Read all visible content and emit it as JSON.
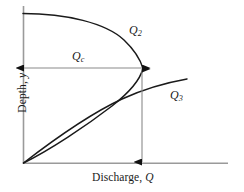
{
  "figure": {
    "type": "diagram",
    "axes": {
      "x_label_text": "Discharge, ",
      "x_label_symbol": "Q",
      "y_label_text": "Depth, ",
      "y_label_symbol": "y",
      "x_axis_name": "Discharge",
      "y_axis_name": "Depth",
      "x_axis_color": "#9a9a9a",
      "y_axis_color": "#9a9a9a",
      "x_origin_px": 23,
      "y_origin_px": 163,
      "x_end_px": 228,
      "y_top_px": 6
    },
    "curve_color": "#1a1a1a",
    "dimension_color": "#7a7a7a",
    "labels": {
      "q2": {
        "symbol": "Q",
        "subscript": "2",
        "x_px": 129,
        "y_px": 24
      },
      "q3": {
        "symbol": "Q",
        "subscript": "3",
        "x_px": 170,
        "y_px": 89
      },
      "qc": {
        "symbol": "Q",
        "subscript": "c",
        "x_px": 72,
        "y_px": 50
      }
    },
    "dimensions": {
      "qc_arrow": {
        "name": "critical-discharge-dimension",
        "orientation": "horizontal",
        "x1_px": 23,
        "y1_px": 68,
        "x2_px": 143,
        "y2_px": 68,
        "arrows": "both"
      },
      "depth_arrow": {
        "name": "critical-depth-dimension",
        "orientation": "vertical",
        "x1_px": 142,
        "y1_px": 68,
        "x2_px": 142,
        "y2_px": 163,
        "arrows": "both"
      }
    },
    "curves": [
      {
        "name": "upper-branch-q2",
        "note": "Upper alternate-depth branch descending from high depth to the critical point"
      },
      {
        "name": "lower-branch",
        "note": "Lower branch returning from the critical point down to the origin"
      },
      {
        "name": "q3-branch",
        "note": "Q3 curve rising from origin past the crossing point toward the right"
      }
    ]
  }
}
